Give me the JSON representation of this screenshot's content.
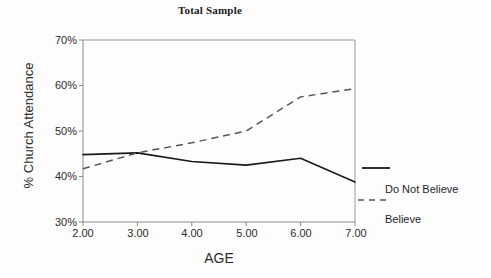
{
  "chart_data": {
    "type": "line",
    "title": "Total Sample",
    "xlabel": "AGE",
    "ylabel": "% Church Attendance",
    "x": [
      2,
      3,
      4,
      5,
      6,
      7
    ],
    "xtick_labels": [
      "2.00",
      "3.00",
      "4.00",
      "5.00",
      "6.00",
      "7.00"
    ],
    "ytick_labels": [
      "70%",
      "60%",
      "50%",
      "40%",
      "30%"
    ],
    "ytick_values": [
      70,
      60,
      50,
      40,
      30
    ],
    "xlim": [
      2,
      7
    ],
    "ylim": [
      30,
      70
    ],
    "grid": false,
    "legend_position": "right",
    "series": [
      {
        "name": "Do Not Believe",
        "style": "solid",
        "color": "#1a1a1a",
        "values": [
          44.8,
          45.2,
          43.3,
          42.5,
          44.0,
          38.8
        ]
      },
      {
        "name": "Believe",
        "style": "dashed",
        "color": "#555555",
        "values": [
          41.7,
          45.2,
          47.4,
          50.0,
          57.5,
          59.3
        ]
      }
    ]
  },
  "legend": {
    "items": [
      {
        "label": "Do Not Believe",
        "style": "solid"
      },
      {
        "label": "Believe",
        "style": "dashed"
      }
    ]
  },
  "colors": {
    "background": "#fdfdfd",
    "axis": "#8a8a8a",
    "solid_series": "#1a1a1a",
    "dashed_series": "#555555",
    "text": "#2b2b2b"
  }
}
